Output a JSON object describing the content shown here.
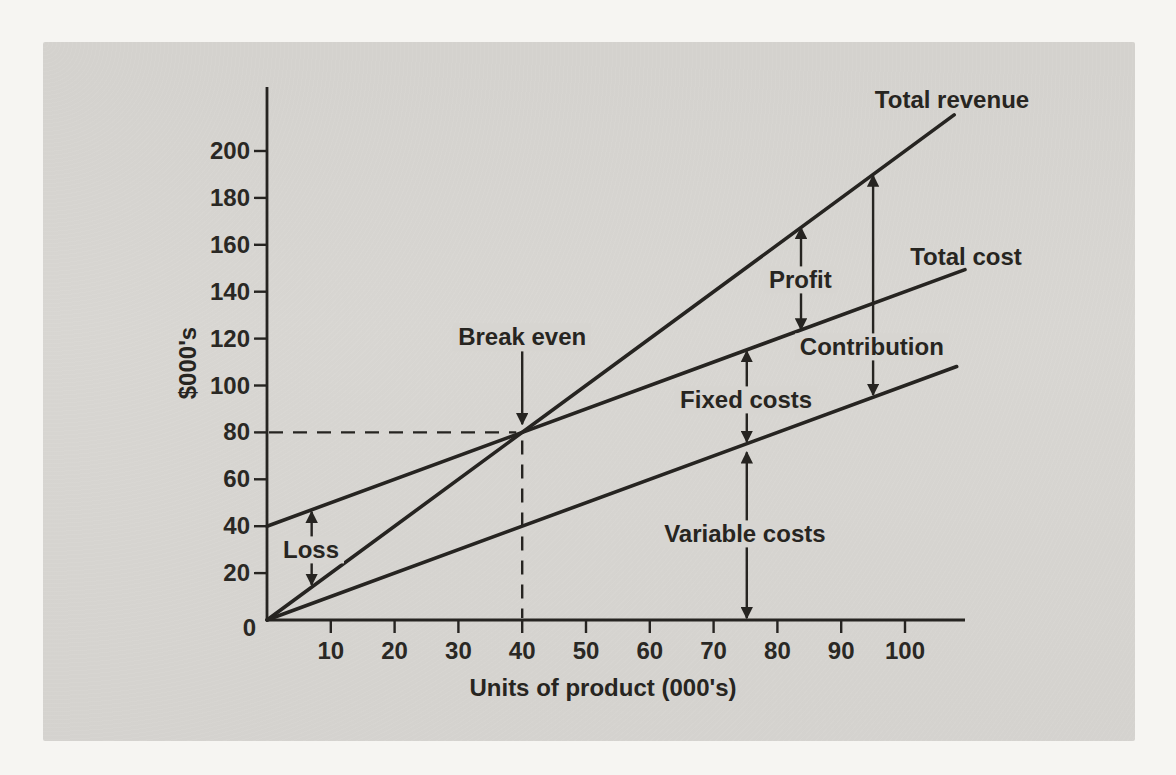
{
  "figure": {
    "background_color": "#f6f5f2",
    "panel_color": "#d7d5d1",
    "ink_color": "#262421"
  },
  "chart_data": {
    "type": "line",
    "title": "",
    "xlabel": "Units of product (000's)",
    "ylabel": "$000's",
    "origin_label": "0",
    "x_ticks": [
      10,
      20,
      30,
      40,
      50,
      60,
      70,
      80,
      90,
      100
    ],
    "y_ticks": [
      20,
      40,
      60,
      80,
      100,
      120,
      140,
      160,
      180,
      200
    ],
    "xlim": [
      0,
      109
    ],
    "ylim": [
      0,
      228
    ],
    "grid": false,
    "legend_position": "line-end-labels",
    "series": [
      {
        "name": "Total revenue",
        "slope_per_unit": 2,
        "intercept": 0,
        "points": [
          [
            0,
            0
          ],
          [
            107.7,
            215.4
          ]
        ],
        "label_px": [
          952,
          100
        ]
      },
      {
        "name": "Total cost",
        "slope_per_unit": 1,
        "intercept": 40,
        "points": [
          [
            0,
            40
          ],
          [
            109.4,
            149.4
          ]
        ],
        "label_px": [
          966,
          257
        ]
      },
      {
        "name": "Variable costs (line)",
        "display_name": "",
        "slope_per_unit": 1,
        "intercept": 0,
        "points": [
          [
            0,
            0
          ],
          [
            108.1,
            108.1
          ]
        ],
        "label_px": null
      }
    ],
    "break_even": {
      "label": "Break even",
      "units_000s": 40,
      "value_000s": 80
    },
    "annotations": [
      {
        "label": "Break even",
        "x": 40,
        "from": 115.5,
        "to": 83.5,
        "heads": "end",
        "label_at": [
          40.0,
          120.5
        ]
      },
      {
        "label": "Loss",
        "x": 7.0,
        "from": 46.2,
        "to": 15.0,
        "heads": "both",
        "label_at": [
          6.9,
          29.9
        ]
      },
      {
        "label": "Profit",
        "x": 83.7,
        "from": 167.3,
        "to": 123.9,
        "heads": "both",
        "label_at": [
          83.6,
          145.0
        ]
      },
      {
        "label": "Contribution",
        "x": 95.0,
        "from": 189.5,
        "to": 96.0,
        "heads": "both",
        "label_at": [
          94.8,
          116.4
        ]
      },
      {
        "label": "Fixed costs",
        "x": 75.2,
        "from": 114.6,
        "to": 76.0,
        "heads": "both",
        "label_at": [
          75.1,
          93.8
        ]
      },
      {
        "label": "Variable costs",
        "x": 75.2,
        "from": 71.5,
        "to": 0.8,
        "heads": "both",
        "label_at": [
          74.9,
          36.7
        ]
      }
    ]
  }
}
